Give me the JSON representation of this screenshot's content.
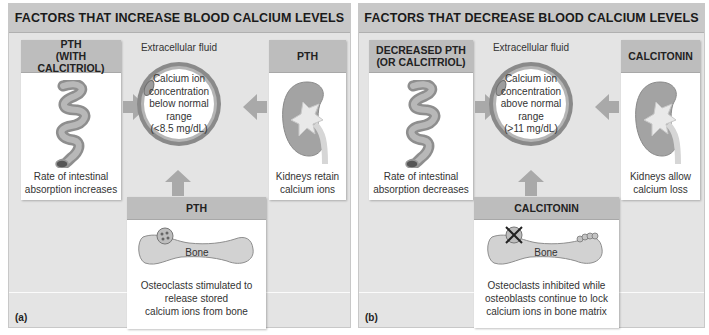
{
  "panels": [
    {
      "title": "FACTORS THAT INCREASE BLOOD CALCIUM LEVELS",
      "label": "(a)",
      "left_card": {
        "header": "PTH\n(WITH CALCITRIOL)",
        "header_line1": "PTH",
        "header_line2": "(WITH CALCITRIOL)",
        "icon": "intestine-icon",
        "text_line1": "Rate of intestinal",
        "text_line2": "absorption increases"
      },
      "center": {
        "fluid_label": "Extracellular fluid",
        "line1": "Calcium ion",
        "line2": "concentration",
        "line3": "below normal",
        "line4": "range",
        "line5": "(<8.5 mg/dL)"
      },
      "right_card": {
        "header": "PTH",
        "icon": "kidney-icon",
        "text_line1": "Kidneys retain",
        "text_line2": "calcium ions"
      },
      "bottom_card": {
        "header": "PTH",
        "icon": "bone-icon",
        "bone_label": "Bone",
        "text_line1": "Osteoclasts stimulated to",
        "text_line2": "release stored",
        "text_line3": "calcium ions from bone"
      }
    },
    {
      "title": "FACTORS THAT DECREASE BLOOD CALCIUM LEVELS",
      "label": "(b)",
      "left_card": {
        "header": "DECREASED PTH\n(OR CALCITRIOL)",
        "header_line1": "DECREASED PTH",
        "header_line2": "(OR CALCITRIOL)",
        "icon": "intestine-icon",
        "text_line1": "Rate of intestinal",
        "text_line2": "absorption decreases"
      },
      "center": {
        "fluid_label": "Extracellular fluid",
        "line1": "Calcium ion",
        "line2": "concentration",
        "line3": "above normal",
        "line4": "range",
        "line5": "(>11 mg/dL)"
      },
      "right_card": {
        "header": "CALCITONIN",
        "icon": "kidney-icon",
        "text_line1": "Kidneys allow",
        "text_line2": "calcium loss"
      },
      "bottom_card": {
        "header": "CALCITONIN",
        "icon": "bone-icon",
        "bone_label": "Bone",
        "text_line1": "Osteoclasts inhibited while",
        "text_line2": "osteoblasts continue to lock",
        "text_line3": "calcium ions in bone matrix"
      }
    }
  ],
  "colors": {
    "panel_bg": "#e4e4e4",
    "title_bar": "#c8c8c8",
    "card_header": "#bdbdbd",
    "arrow": "#a9a9a9",
    "vessel": "#9a9a9a",
    "organ": "#a6a6a6"
  }
}
